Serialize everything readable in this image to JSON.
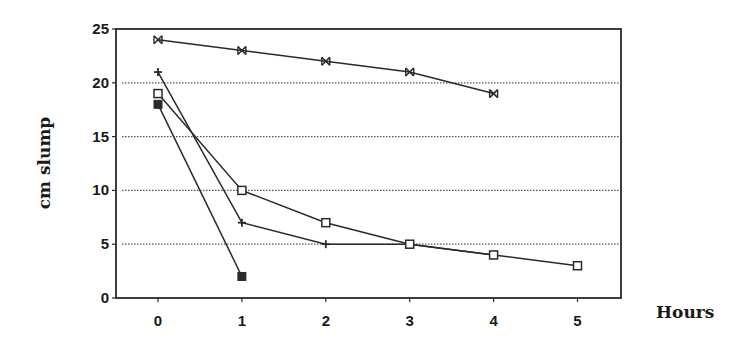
{
  "chart_data": {
    "type": "line",
    "title": "",
    "xlabel": "Hours",
    "ylabel": "cm slump",
    "x": [
      0,
      1,
      2,
      3,
      4,
      5
    ],
    "x_tick_labels": [
      "0",
      "1",
      "2",
      "3",
      "4",
      "5"
    ],
    "y_tick_labels": [
      "0",
      "5",
      "10",
      "15",
      "20",
      "25"
    ],
    "y_ticks": [
      0,
      5,
      10,
      15,
      20,
      25
    ],
    "ylim": [
      0,
      25
    ],
    "xlim": [
      -0.5,
      5.5
    ],
    "grid": {
      "horizontal": true,
      "style": "dotted",
      "values": [
        5,
        10,
        15,
        20
      ]
    },
    "legend": null,
    "series": [
      {
        "name": "asterisk-series",
        "marker": "asterisk",
        "x": [
          0,
          1,
          2,
          3,
          4
        ],
        "values": [
          24,
          23,
          22,
          21,
          19
        ]
      },
      {
        "name": "plus-series",
        "marker": "plus",
        "x": [
          0,
          1,
          2,
          3,
          4
        ],
        "values": [
          21,
          7,
          5,
          5,
          4
        ]
      },
      {
        "name": "open-square-series",
        "marker": "open-square",
        "x": [
          0,
          1,
          2,
          3,
          4,
          5
        ],
        "values": [
          19,
          10,
          7,
          5,
          4,
          3
        ]
      },
      {
        "name": "filled-square-series",
        "marker": "filled-square",
        "x": [
          0,
          1
        ],
        "values": [
          18,
          2
        ]
      }
    ]
  },
  "layout": {
    "plot": {
      "left": 116,
      "right": 621,
      "top": 29,
      "bottom": 298
    },
    "x_pixel": {
      "origin": 158,
      "per_unit": 83.9
    },
    "line_color": "#2a2a2a",
    "grid_color": "#555555"
  }
}
